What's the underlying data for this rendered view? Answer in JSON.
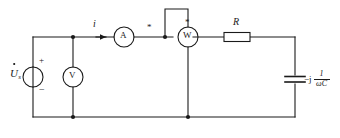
{
  "diagram": {
    "type": "circuit-schematic",
    "stroke_color": "#1a1a1a",
    "background_color": "#ffffff",
    "components": {
      "source": {
        "name": "voltage-source",
        "label_main": "U",
        "label_subscript": "s",
        "label_dot": "phasor-dot",
        "terminal_plus": "+",
        "terminal_minus": "−"
      },
      "voltmeter": {
        "name": "voltmeter",
        "symbol": "V"
      },
      "ammeter": {
        "name": "ammeter",
        "symbol": "A"
      },
      "wattmeter": {
        "name": "wattmeter",
        "symbol": "W",
        "current_coil_polarity_mark": "*",
        "voltage_coil_polarity_mark": "*"
      },
      "resistor": {
        "name": "resistor",
        "label": "R"
      },
      "capacitor": {
        "name": "capacitor",
        "impedance_prefix": "−j",
        "impedance_numerator": "1",
        "impedance_denominator": "ωC"
      },
      "current": {
        "name": "branch-current",
        "label": "i",
        "direction": "right"
      }
    }
  }
}
